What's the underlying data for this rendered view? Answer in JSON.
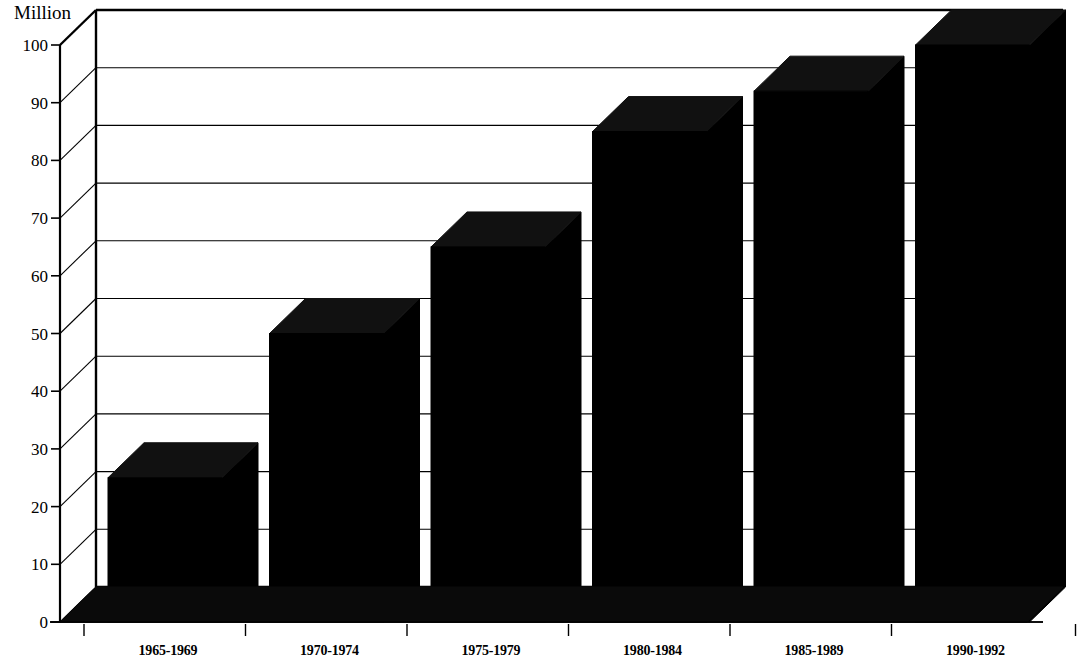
{
  "chart_data": {
    "type": "bar",
    "title": "",
    "ylabel": "Million",
    "xlabel": "",
    "categories": [
      "1965-1969",
      "1970-1974",
      "1975-1979",
      "1980-1984",
      "1985-1989",
      "1990-1992"
    ],
    "values": [
      25,
      50,
      65,
      85,
      92,
      100
    ],
    "ylim": [
      0,
      100
    ],
    "yticks": [
      "0",
      "10",
      "20",
      "30",
      "40",
      "50",
      "60",
      "70",
      "80",
      "90",
      "100"
    ],
    "ytick_values": [
      0,
      10,
      20,
      30,
      40,
      50,
      60,
      70,
      80,
      90,
      100
    ],
    "grid": true,
    "legend": "none",
    "style": {
      "bar_color": "#000000",
      "bar_top_color": "#111111",
      "floor_color": "#0a0a0a",
      "wall_color": "#ffffff",
      "line_color": "#000000",
      "projection": "3d-isometric"
    }
  }
}
